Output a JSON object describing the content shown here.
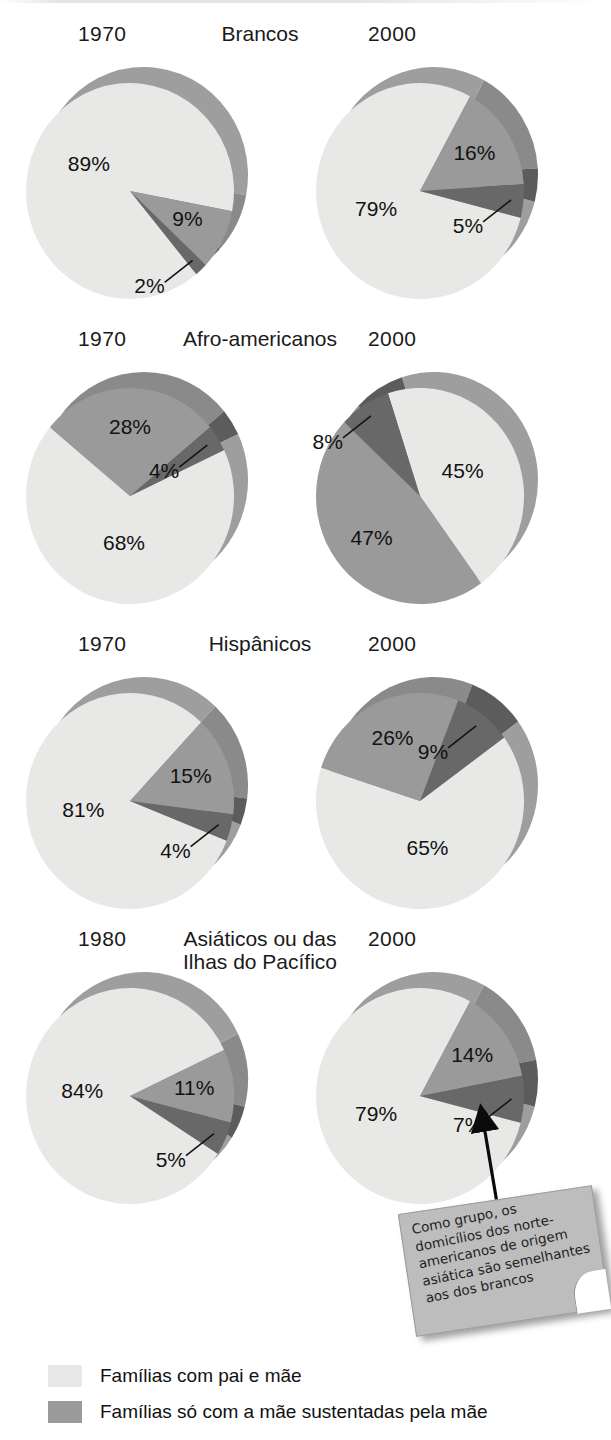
{
  "figure": {
    "palette": {
      "slice_two_parent": "#e8e8e6",
      "slice_mother_only": "#9a9a9a",
      "slice_third": "#686868",
      "depth_light": "#9e9e9e",
      "depth_mid": "#8a8a8a",
      "depth_dark": "#5c5c5c",
      "text": "#121212",
      "note_paper": "#bdbdbd",
      "background": "#ffffff"
    }
  },
  "groups": [
    {
      "title": "Brancos",
      "year_left": "1970",
      "year_right": "2000",
      "left": {
        "year": "1970",
        "slices": [
          {
            "label": "89%",
            "value": 89,
            "color": "slice_two_parent"
          },
          {
            "label": "9%",
            "value": 9,
            "color": "slice_mother_only"
          },
          {
            "label": "2%",
            "value": 2,
            "color": "slice_third"
          }
        ]
      },
      "right": {
        "year": "2000",
        "slices": [
          {
            "label": "79%",
            "value": 79,
            "color": "slice_two_parent"
          },
          {
            "label": "16%",
            "value": 16,
            "color": "slice_mother_only"
          },
          {
            "label": "5%",
            "value": 5,
            "color": "slice_third"
          }
        ]
      }
    },
    {
      "title": "Afro-americanos",
      "year_left": "1970",
      "year_right": "2000",
      "left": {
        "year": "1970",
        "slices": [
          {
            "label": "68%",
            "value": 68,
            "color": "slice_two_parent"
          },
          {
            "label": "28%",
            "value": 28,
            "color": "slice_mother_only"
          },
          {
            "label": "4%",
            "value": 4,
            "color": "slice_third"
          }
        ]
      },
      "right": {
        "year": "2000",
        "slices": [
          {
            "label": "45%",
            "value": 45,
            "color": "slice_two_parent"
          },
          {
            "label": "47%",
            "value": 47,
            "color": "slice_mother_only"
          },
          {
            "label": "8%",
            "value": 8,
            "color": "slice_third"
          }
        ]
      }
    },
    {
      "title": "Hispânicos",
      "year_left": "1970",
      "year_right": "2000",
      "left": {
        "year": "1970",
        "slices": [
          {
            "label": "81%",
            "value": 81,
            "color": "slice_two_parent"
          },
          {
            "label": "15%",
            "value": 15,
            "color": "slice_mother_only"
          },
          {
            "label": "4%",
            "value": 4,
            "color": "slice_third"
          }
        ]
      },
      "right": {
        "year": "2000",
        "slices": [
          {
            "label": "65%",
            "value": 65,
            "color": "slice_two_parent"
          },
          {
            "label": "26%",
            "value": 26,
            "color": "slice_mother_only"
          },
          {
            "label": "9%",
            "value": 9,
            "color": "slice_third"
          }
        ]
      }
    },
    {
      "title": "Asiáticos ou das Ilhas do Pacífico",
      "year_left": "1980",
      "year_right": "2000",
      "left": {
        "year": "1980",
        "slices": [
          {
            "label": "84%",
            "value": 84,
            "color": "slice_two_parent"
          },
          {
            "label": "11%",
            "value": 11,
            "color": "slice_mother_only"
          },
          {
            "label": "5%",
            "value": 5,
            "color": "slice_third"
          }
        ]
      },
      "right": {
        "year": "2000",
        "slices": [
          {
            "label": "79%",
            "value": 79,
            "color": "slice_two_parent"
          },
          {
            "label": "14%",
            "value": 14,
            "color": "slice_mother_only"
          },
          {
            "label": "7%",
            "value": 7,
            "color": "slice_third"
          }
        ]
      }
    }
  ],
  "legend": {
    "items": [
      {
        "label": "Famílias com pai e mãe",
        "color": "slice_two_parent"
      },
      {
        "label": "Famílias só com a mãe sustentadas pela mãe",
        "color": "slice_mother_only"
      }
    ]
  },
  "note": {
    "text": "Como grupo, os domicílios dos norte-americanos de origem asiática são semelhantes aos dos brancos"
  },
  "chart_data": {
    "type": "pie",
    "legend_position": "bottom-left",
    "categories": [
      "Famílias com pai e mãe",
      "Famílias só com a mãe sustentadas pela mãe",
      "Outras"
    ],
    "units": "percent",
    "panels": [
      {
        "group": "Brancos",
        "year": "1970",
        "values": [
          89,
          9,
          2
        ]
      },
      {
        "group": "Brancos",
        "year": "2000",
        "values": [
          79,
          16,
          5
        ]
      },
      {
        "group": "Afro-americanos",
        "year": "1970",
        "values": [
          68,
          28,
          4
        ]
      },
      {
        "group": "Afro-americanos",
        "year": "2000",
        "values": [
          45,
          47,
          8
        ]
      },
      {
        "group": "Hispânicos",
        "year": "1970",
        "values": [
          81,
          15,
          4
        ]
      },
      {
        "group": "Hispânicos",
        "year": "2000",
        "values": [
          65,
          26,
          9
        ]
      },
      {
        "group": "Asiáticos ou das Ilhas do Pacífico",
        "year": "1980",
        "values": [
          84,
          11,
          5
        ]
      },
      {
        "group": "Asiáticos ou das Ilhas do Pacífico",
        "year": "2000",
        "values": [
          79,
          14,
          7
        ]
      }
    ],
    "annotation": "Como grupo, os domicílios dos norte-americanos de origem asiática são semelhantes aos dos brancos"
  }
}
